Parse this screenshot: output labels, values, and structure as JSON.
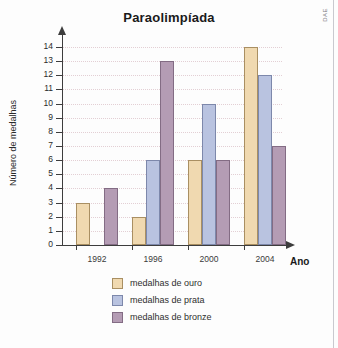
{
  "credit": "DAE",
  "chart_data": {
    "type": "bar",
    "title": "Paraolimpíada",
    "xlabel": "Ano",
    "ylabel": "Número de medalhas",
    "categories": [
      "1992",
      "1996",
      "2000",
      "2004"
    ],
    "series": [
      {
        "name": "medalhas de ouro",
        "color": "#f0d9b0",
        "values": [
          3,
          2,
          6,
          14
        ]
      },
      {
        "name": "medalhas de prata",
        "color": "#b9c3e0",
        "values": [
          null,
          6,
          10,
          12
        ]
      },
      {
        "name": "medalhas de bronze",
        "color": "#b49cb4",
        "values": [
          4,
          13,
          6,
          7
        ]
      }
    ],
    "ylim": [
      0,
      14
    ],
    "yticks": [
      "0",
      "1",
      "2",
      "3",
      "4",
      "5",
      "6",
      "7",
      "8",
      "9",
      "10",
      "11",
      "12",
      "13",
      "14"
    ],
    "grid": true,
    "legend_position": "bottom"
  }
}
